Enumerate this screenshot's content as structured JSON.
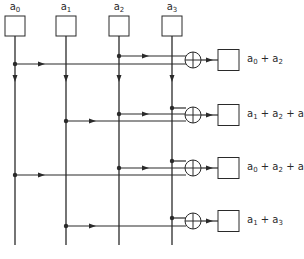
{
  "colors": {
    "stroke": "#2a2a2a",
    "background": "#ffffff"
  },
  "inputs": [
    {
      "id": "a0",
      "label": "a",
      "sub": "0",
      "x": 15
    },
    {
      "id": "a1",
      "label": "a",
      "sub": "1",
      "x": 66
    },
    {
      "id": "a2",
      "label": "a",
      "sub": "2",
      "x": 119
    },
    {
      "id": "a3",
      "label": "a",
      "sub": "3",
      "x": 172
    }
  ],
  "outputs": [
    {
      "label_html": "a<sub>0</sub> + a<sub>2</sub>",
      "text": "a0 + a2",
      "y": 60,
      "taps": [
        {
          "input": "a2",
          "y": 56
        },
        {
          "input": "a0",
          "y": 64
        }
      ]
    },
    {
      "label_html": "a<sub>1</sub> + a<sub>2</sub> + a<sub>3</sub>",
      "text": "a1 + a2 + a3",
      "y": 115,
      "taps": [
        {
          "input": "a3",
          "y": 108
        },
        {
          "input": "a2",
          "y": 114
        },
        {
          "input": "a1",
          "y": 121
        }
      ]
    },
    {
      "label_html": "a<sub>0</sub> + a<sub>2</sub> + a<sub>3</sub>",
      "text": "a0 + a2 + a3",
      "y": 168,
      "taps": [
        {
          "input": "a3",
          "y": 161
        },
        {
          "input": "a2",
          "y": 168
        },
        {
          "input": "a0",
          "y": 175
        }
      ]
    },
    {
      "label_html": "a<sub>1</sub> + a<sub>3</sub>",
      "text": "a1 + a3",
      "y": 221,
      "taps": [
        {
          "input": "a3",
          "y": 218
        },
        {
          "input": "a1",
          "y": 226
        }
      ]
    }
  ],
  "geometry": {
    "input_box": {
      "w": 20,
      "h": 20,
      "top": 16
    },
    "line_end_y": 245,
    "down_arrow_y": 79,
    "xor_cx": 193,
    "xor_r": 8,
    "out_box": {
      "x": 218,
      "w": 21,
      "h": 21
    },
    "label_x": 247
  },
  "caption": "Exclusive-OR network computing a0+a2, a1+a2+a3, a0+a2+a3, a1+a3"
}
